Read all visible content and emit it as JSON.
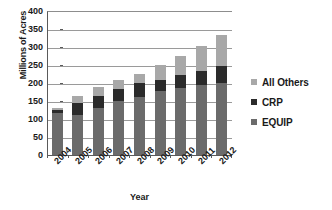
{
  "chart_data": {
    "type": "bar",
    "subtype": "stacked-column",
    "title": "",
    "xlabel": "Year",
    "ylabel": "Millions of Acres",
    "categories": [
      "2004",
      "2005",
      "2006",
      "2007",
      "2008",
      "2009",
      "2010",
      "2011",
      "2012"
    ],
    "ylim": [
      0,
      400
    ],
    "yticks": [
      0,
      50,
      100,
      150,
      200,
      250,
      300,
      350,
      400
    ],
    "ytick_labels": [
      "0",
      "50",
      "100",
      "150",
      "200",
      "250",
      "300",
      "350",
      "400"
    ],
    "grid": true,
    "grid_axis": "y",
    "legend_position": "right",
    "series": [
      {
        "name": "EQUIP",
        "color": "#6b6b6b",
        "values": [
          118,
          112,
          130,
          150,
          162,
          178,
          186,
          195,
          200
        ]
      },
      {
        "name": "CRP",
        "color": "#2b2b2b",
        "values": [
          8,
          33,
          34,
          32,
          38,
          30,
          36,
          38,
          48
        ]
      },
      {
        "name": "All Others",
        "color": "#a8a8a8",
        "values": [
          6,
          18,
          25,
          26,
          26,
          43,
          54,
          70,
          85
        ]
      }
    ],
    "stack_order_bottom_to_top": [
      "EQUIP",
      "CRP",
      "All Others"
    ],
    "totals": [
      132,
      163,
      189,
      208,
      226,
      251,
      276,
      303,
      333
    ]
  },
  "legend": {
    "items": [
      {
        "label": "All Others",
        "swatch_name": "legend-swatch-all-others"
      },
      {
        "label": "CRP",
        "swatch_name": "legend-swatch-crp"
      },
      {
        "label": "EQUIP",
        "swatch_name": "legend-swatch-equip"
      }
    ]
  },
  "axes": {
    "y_title": "Millions of Acres",
    "x_title": "Year"
  },
  "colors": {
    "all_others": "#a8a8a8",
    "crp": "#2b2b2b",
    "equip": "#6b6b6b",
    "gridline": "#9a9a9a",
    "axis": "#5a5a5a",
    "text": "#1a1a1a",
    "background": "#ffffff"
  }
}
